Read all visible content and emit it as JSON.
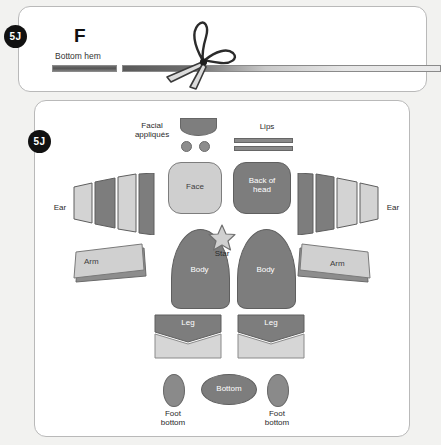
{
  "document": {
    "title": "Sewing pattern pieces layout",
    "background_color": "#f2f2f0",
    "panel_color": "#ffffff"
  },
  "steps": [
    {
      "badge": "5J",
      "panel": "top"
    },
    {
      "badge": "5J",
      "panel": "main"
    }
  ],
  "top_panel": {
    "letter": "F",
    "hem_label": "Bottom hem",
    "scissors_icon": "scissors-icon",
    "strips": [
      {
        "name": "hem-strip-short",
        "tone": "dark"
      },
      {
        "name": "hem-strip-long",
        "tone": "gradient-light"
      }
    ]
  },
  "main_panel": {
    "labels": {
      "facial_appliques": "Facial\nappliqués",
      "lips": "Lips",
      "face": "Face",
      "back_of_head": "Back of\nhead",
      "ear_left": "Ear",
      "ear_right": "Ear",
      "arm_left": "Arm",
      "arm_right": "Arm",
      "body_left": "Body",
      "body_right": "Body",
      "star": "Star",
      "leg_left": "Leg",
      "leg_right": "Leg",
      "bottom": "Bottom",
      "foot_bottom_left": "Foot\nbottom",
      "foot_bottom_right": "Foot\nbottom"
    },
    "pieces": {
      "facial_appliques_count": 3,
      "lip_strips": 2,
      "ear_panels_per_side": 4,
      "body_pieces": 2,
      "leg_pieces": 2,
      "foot_bottom_pieces": 2
    }
  },
  "colors": {
    "dark_fabric": "#7d7d7d",
    "light_fabric": "#d0d0d0",
    "mid_fabric": "#8a8a8a",
    "outline": "#5f5f5f",
    "badge": "#111111"
  }
}
